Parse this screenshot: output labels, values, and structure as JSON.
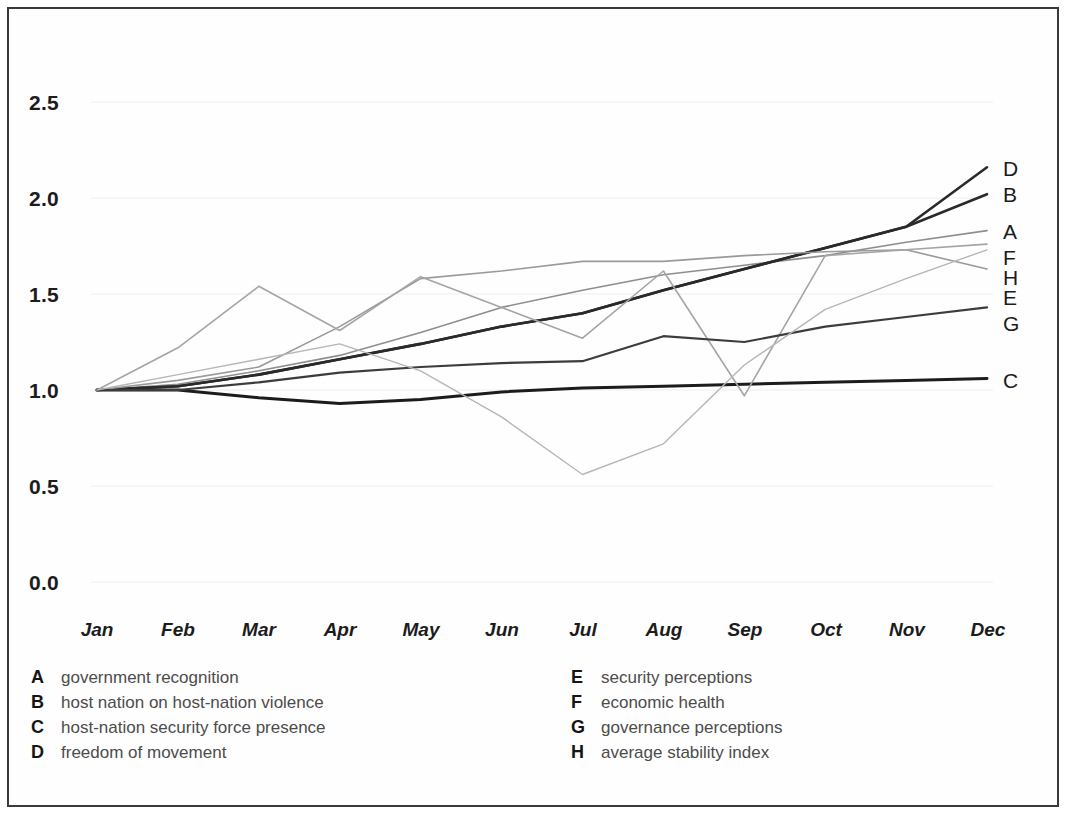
{
  "figure": {
    "border_color": "#3a3a3a",
    "background": "#ffffff"
  },
  "axes": {
    "y_ticks": [
      "0.0",
      "0.5",
      "1.0",
      "1.5",
      "2.0",
      "2.5"
    ],
    "x_ticks": [
      "Jan",
      "Feb",
      "Mar",
      "Apr",
      "May",
      "Jun",
      "Jul",
      "Aug",
      "Sep",
      "Oct",
      "Nov",
      "Dec"
    ]
  },
  "series_end_labels": [
    {
      "key": "D",
      "y_value": 2.16
    },
    {
      "key": "B",
      "y_value": 2.02
    },
    {
      "key": "A",
      "y_value": 1.83
    },
    {
      "key": "F",
      "y_value": 1.76
    },
    {
      "key": "H",
      "y_value": 1.73
    },
    {
      "key": "E",
      "y_value": 1.63
    },
    {
      "key": "G",
      "y_value": 1.43
    },
    {
      "key": "C",
      "y_value": 1.06
    }
  ],
  "legend": {
    "left_column": [
      {
        "key": "A",
        "label": "government recognition"
      },
      {
        "key": "B",
        "label": "host nation on host-nation violence"
      },
      {
        "key": "C",
        "label": "host-nation security force presence"
      },
      {
        "key": "D",
        "label": "freedom of movement"
      }
    ],
    "right_column": [
      {
        "key": "E",
        "label": "security perceptions"
      },
      {
        "key": "F",
        "label": "economic health"
      },
      {
        "key": "G",
        "label": "governance perceptions"
      },
      {
        "key": "H",
        "label": "average stability index"
      }
    ]
  },
  "chart_data": {
    "type": "line",
    "title": "",
    "xlabel": "",
    "ylabel": "",
    "categories": [
      "Jan",
      "Feb",
      "Mar",
      "Apr",
      "May",
      "Jun",
      "Jul",
      "Aug",
      "Sep",
      "Oct",
      "Nov",
      "Dec"
    ],
    "ylim": [
      0.0,
      2.5
    ],
    "yticks": [
      0.0,
      0.5,
      1.0,
      1.5,
      2.0,
      2.5
    ],
    "grid": false,
    "legend_position": "below-axes",
    "series": [
      {
        "name": "A",
        "label": "government recognition",
        "color": "#8e8e8e",
        "width": 1.6,
        "values": [
          1.0,
          1.03,
          1.1,
          1.18,
          1.3,
          1.43,
          1.52,
          1.6,
          1.65,
          1.7,
          1.77,
          1.83
        ]
      },
      {
        "name": "B",
        "label": "host nation on host-nation violence",
        "color": "#2a2a2a",
        "width": 2.6,
        "values": [
          1.0,
          1.02,
          1.08,
          1.16,
          1.24,
          1.33,
          1.4,
          1.52,
          1.63,
          1.74,
          1.85,
          2.02
        ]
      },
      {
        "name": "C",
        "label": "host-nation security force presence",
        "color": "#1c1c1c",
        "width": 3.0,
        "values": [
          1.0,
          1.0,
          0.96,
          0.93,
          0.95,
          0.99,
          1.01,
          1.02,
          1.03,
          1.04,
          1.05,
          1.06
        ]
      },
      {
        "name": "D",
        "label": "freedom of movement",
        "color": "#2a2a2a",
        "width": 2.6,
        "values": [
          1.0,
          1.02,
          1.08,
          1.16,
          1.24,
          1.33,
          1.4,
          1.52,
          1.63,
          1.74,
          1.85,
          2.16
        ]
      },
      {
        "name": "E",
        "label": "security perceptions",
        "color": "#9a9a9a",
        "width": 1.6,
        "values": [
          1.0,
          1.05,
          1.12,
          1.33,
          1.58,
          1.62,
          1.67,
          1.67,
          1.7,
          1.72,
          1.73,
          1.63
        ]
      },
      {
        "name": "F",
        "label": "economic health",
        "color": "#a5a5a5",
        "width": 1.6,
        "values": [
          1.0,
          1.22,
          1.54,
          1.31,
          1.59,
          1.43,
          1.27,
          1.62,
          0.97,
          1.7,
          1.73,
          1.76
        ]
      },
      {
        "name": "G",
        "label": "governance perceptions",
        "color": "#3c3c3c",
        "width": 2.2,
        "values": [
          1.0,
          1.0,
          1.04,
          1.09,
          1.12,
          1.14,
          1.15,
          1.28,
          1.25,
          1.33,
          1.38,
          1.43
        ]
      },
      {
        "name": "H",
        "label": "average stability index",
        "color": "#b6b6b6",
        "width": 1.4,
        "values": [
          1.0,
          1.08,
          1.16,
          1.24,
          1.1,
          0.86,
          0.56,
          0.72,
          1.13,
          1.42,
          1.58,
          1.73
        ]
      }
    ]
  }
}
